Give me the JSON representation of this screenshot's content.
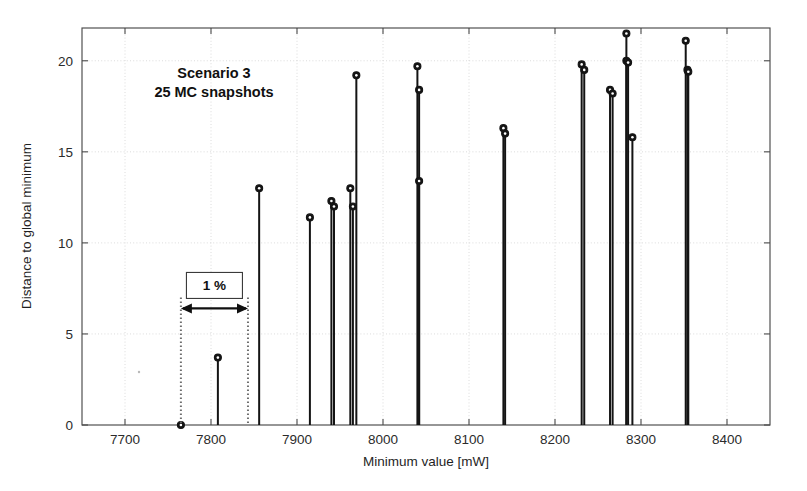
{
  "figure": {
    "background_color": "#ffffff",
    "annotations": [
      {
        "name": "scenario-line-1",
        "text": "Scenario 3"
      },
      {
        "name": "scenario-line-2",
        "text": "25 MC snapshots"
      },
      {
        "name": "span-label",
        "text": "1 %"
      }
    ]
  },
  "chart_data": {
    "type": "scatter",
    "subtype": "stem",
    "title": "",
    "subtitle": "",
    "xlabel": "Minimum value [mW]",
    "ylabel": "Distance to global minimum",
    "xlim": [
      7650,
      8450
    ],
    "ylim": [
      0,
      21.8
    ],
    "xticks": [
      7700,
      7800,
      7900,
      8000,
      8100,
      8200,
      8300,
      8400
    ],
    "xticklabels": [
      "7700",
      "7800",
      "7900",
      "8000",
      "8100",
      "8200",
      "8300",
      "8400"
    ],
    "yticks": [
      0,
      5,
      10,
      15,
      20
    ],
    "yticklabels": [
      "0",
      "5",
      "10",
      "15",
      "20"
    ],
    "grid": true,
    "grid_style": "dotted",
    "legend": false,
    "legend_position": "none",
    "marker": "filled-circle",
    "line_color": "#141414",
    "marker_color": "#141414",
    "series": [
      {
        "name": "MC snapshots",
        "points": [
          {
            "x": 7765,
            "y": 0.0
          },
          {
            "x": 7808,
            "y": 3.7
          },
          {
            "x": 7856,
            "y": 13.0
          },
          {
            "x": 7915,
            "y": 11.4
          },
          {
            "x": 7940,
            "y": 12.3
          },
          {
            "x": 7943,
            "y": 12.0
          },
          {
            "x": 7962,
            "y": 13.0
          },
          {
            "x": 7965,
            "y": 12.0
          },
          {
            "x": 7969,
            "y": 19.2
          },
          {
            "x": 8040,
            "y": 19.7
          },
          {
            "x": 8042,
            "y": 18.4
          },
          {
            "x": 8042,
            "y": 13.4
          },
          {
            "x": 8140,
            "y": 16.3
          },
          {
            "x": 8142,
            "y": 16.0
          },
          {
            "x": 8231,
            "y": 19.8
          },
          {
            "x": 8234,
            "y": 19.5
          },
          {
            "x": 8264,
            "y": 18.4
          },
          {
            "x": 8267,
            "y": 18.2
          },
          {
            "x": 8283,
            "y": 21.5
          },
          {
            "x": 8283,
            "y": 20.0
          },
          {
            "x": 8285,
            "y": 19.9
          },
          {
            "x": 8290,
            "y": 15.8
          },
          {
            "x": 8352,
            "y": 21.1
          },
          {
            "x": 8354,
            "y": 19.5
          },
          {
            "x": 8355,
            "y": 19.4
          }
        ]
      }
    ],
    "annotations": [
      {
        "name": "scenario-text",
        "lines": [
          "Scenario 3",
          "25 MC snapshots"
        ],
        "x": 7855,
        "y": 18.6
      },
      {
        "name": "one-percent-span",
        "label": "1 %",
        "x_start": 7765,
        "x_end": 7843,
        "y_arrow": 6.4,
        "y_top": 7.0,
        "y_bottom": 0.0
      }
    ]
  }
}
